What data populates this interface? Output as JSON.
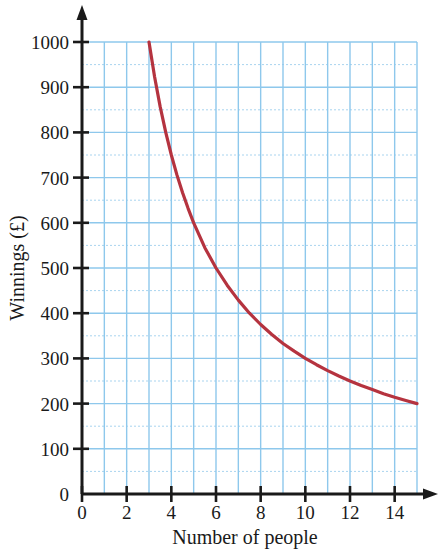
{
  "chart_data": {
    "type": "line",
    "title": "",
    "subtitle": "",
    "xlabel": "Number of people",
    "ylabel": "Winnings (£)",
    "xlim": [
      0,
      15
    ],
    "ylim": [
      0,
      1000
    ],
    "grid": true,
    "legend": null,
    "relationship": "y = 3000 / x (inverse proportion)",
    "x_major_ticks": [
      0,
      2,
      4,
      6,
      8,
      10,
      12,
      14
    ],
    "x_major_tick_labels": [
      "0",
      "2",
      "4",
      "6",
      "8",
      "10",
      "12",
      "14"
    ],
    "x_minor_gridline_step": 1,
    "y_major_ticks": [
      0,
      100,
      200,
      300,
      400,
      500,
      600,
      700,
      800,
      900,
      1000
    ],
    "y_major_tick_labels": [
      "0",
      "100",
      "200",
      "300",
      "400",
      "500",
      "600",
      "700",
      "800",
      "900",
      "1000"
    ],
    "y_minor_gridline_step": 50,
    "series": [
      {
        "name": "Winnings",
        "color": "#b5333f",
        "x": [
          3,
          3.25,
          3.5,
          3.75,
          4,
          4.25,
          4.5,
          4.75,
          5,
          5.5,
          6,
          6.5,
          7,
          7.5,
          8,
          8.5,
          9,
          9.5,
          10,
          10.5,
          11,
          11.5,
          12,
          12.5,
          13,
          13.5,
          14,
          14.5,
          15
        ],
        "y": [
          1000,
          923,
          857,
          800,
          750,
          706,
          667,
          632,
          600,
          545,
          500,
          462,
          429,
          400,
          375,
          353,
          333,
          316,
          300,
          286,
          273,
          261,
          250,
          240,
          231,
          222,
          214,
          207,
          200
        ]
      }
    ],
    "annotations": []
  },
  "colors": {
    "curve": "#b5333f",
    "grid_major": "#8ec8ec",
    "grid_minor": "#a9d4ef",
    "axis": "#1a1a1a",
    "background": "#ffffff"
  },
  "icons": {
    "x_axis_arrow": "arrow-right-icon",
    "y_axis_arrow": "arrow-up-icon"
  }
}
